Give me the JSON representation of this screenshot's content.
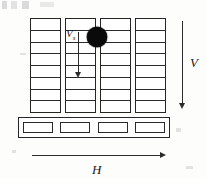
{
  "figure": {
    "background_color": "#fdfdfc",
    "line_color": "#262626"
  },
  "grid": {
    "columns_count": 4,
    "rows_per_column": 8,
    "column_labels": [
      "column-1",
      "column-2",
      "column-3",
      "column-4"
    ]
  },
  "base": {
    "name": "base-beam",
    "cells_count": 4,
    "cell_labels": [
      "base-cell-1",
      "base-cell-2",
      "base-cell-3",
      "base-cell-4"
    ]
  },
  "ball": {
    "name": "impact-mass",
    "color": "#0a0a0a"
  },
  "annotations": {
    "inner_velocity_label": "V",
    "inner_velocity_subscript": "s",
    "vertical_label": "V",
    "horizontal_label": "H"
  },
  "arrows": {
    "inner_vertical": "downward-arrow-inside-column",
    "outer_vertical": "downward-arrow-right-side",
    "horizontal": "rightward-arrow-bottom"
  }
}
